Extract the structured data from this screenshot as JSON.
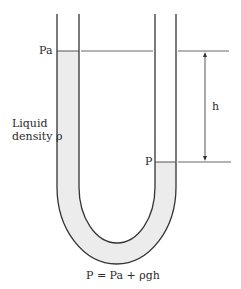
{
  "labels": {
    "pa": "Pa",
    "p": "P",
    "h": "h",
    "liquid_line1": "Liquid",
    "liquid_line2": "density ρ",
    "equation": "P = Pa + ρgh"
  },
  "colors": {
    "line": "#333333",
    "liquid_fill": "#ececec",
    "background": "#ffffff"
  }
}
